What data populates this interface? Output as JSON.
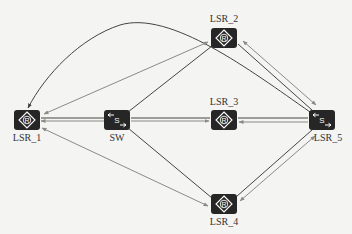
{
  "diagram": {
    "title": "",
    "background": "#f4f4f2",
    "node_color": "#262626",
    "link_color_dark": "#444444",
    "link_color_light": "#8a8a8a",
    "nodes": [
      {
        "id": "LSR_1",
        "label": "LSR_1",
        "type": "router",
        "icon": "router-icon",
        "glyph": "R",
        "x": 27,
        "y": 120
      },
      {
        "id": "SW",
        "label": "SW",
        "type": "switch",
        "icon": "switch-icon",
        "glyph": "S",
        "x": 117,
        "y": 120
      },
      {
        "id": "LSR_2",
        "label": "LSR_2",
        "type": "router",
        "icon": "router-icon",
        "glyph": "R",
        "x": 224,
        "y": 37
      },
      {
        "id": "LSR_3",
        "label": "LSR_3",
        "type": "router",
        "icon": "router-icon",
        "glyph": "R",
        "x": 224,
        "y": 120
      },
      {
        "id": "LSR_5",
        "label": "LSR_5",
        "type": "switch",
        "icon": "switch-icon",
        "glyph": "S",
        "x": 322,
        "y": 120
      },
      {
        "id": "LSR_4",
        "label": "LSR_4",
        "type": "router",
        "icon": "router-icon",
        "glyph": "R",
        "x": 224,
        "y": 205
      }
    ],
    "edges": [
      {
        "from": "LSR_1",
        "to": "SW",
        "style": "double"
      },
      {
        "from": "SW",
        "to": "LSR_3",
        "style": "double"
      },
      {
        "from": "LSR_3",
        "to": "LSR_5",
        "style": "double"
      },
      {
        "from": "SW",
        "to": "LSR_2",
        "style": "single"
      },
      {
        "from": "SW",
        "to": "LSR_4",
        "style": "single"
      },
      {
        "from": "LSR_2",
        "to": "LSR_1",
        "style": "arrow"
      },
      {
        "from": "LSR_1",
        "to": "LSR_4",
        "style": "arrow-both"
      },
      {
        "from": "LSR_2",
        "to": "LSR_5",
        "style": "double-arrow"
      },
      {
        "from": "LSR_4",
        "to": "LSR_5",
        "style": "double-arrow"
      },
      {
        "from": "LSR_5",
        "to": "LSR_1",
        "style": "curve"
      }
    ]
  }
}
